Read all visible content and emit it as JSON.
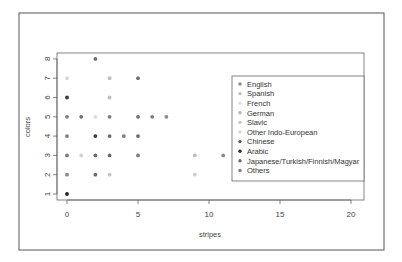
{
  "chart_data": {
    "type": "scatter",
    "title": "",
    "xlabel": "stripes",
    "ylabel": "colors",
    "xlim": [
      0,
      20
    ],
    "ylim": [
      1,
      8
    ],
    "x_ticks": [
      0,
      5,
      10,
      15,
      20
    ],
    "y_ticks": [
      1,
      2,
      3,
      4,
      5,
      6,
      7,
      8
    ],
    "grid": false,
    "legend_position": "right",
    "legend": [
      {
        "label": "English",
        "color": "#8a8a8a"
      },
      {
        "label": "Spanish",
        "color": "#bdbdbd"
      },
      {
        "label": "French",
        "color": "#dedede"
      },
      {
        "label": "German",
        "color": "#b4b4b4"
      },
      {
        "label": "Slavic",
        "color": "#c6c6c6"
      },
      {
        "label": "Other Indo-European",
        "color": "#d8d8d8"
      },
      {
        "label": "Chinese",
        "color": "#555555"
      },
      {
        "label": "Arabic",
        "color": "#2e2e2e"
      },
      {
        "label": "Japanese/Turkish/Finnish/Magyar",
        "color": "#6a6a6a"
      },
      {
        "label": "Others",
        "color": "#7c7c7c"
      }
    ],
    "points": [
      {
        "x": 2,
        "y": 8,
        "color": "#6f6f6f"
      },
      {
        "x": 0,
        "y": 7,
        "color": "#d6d6d6"
      },
      {
        "x": 3,
        "y": 7,
        "color": "#bdbdbd"
      },
      {
        "x": 5,
        "y": 7,
        "color": "#6f6f6f"
      },
      {
        "x": 0,
        "y": 6,
        "color": "#3a3a3a"
      },
      {
        "x": 3,
        "y": 6,
        "color": "#bdbdbd"
      },
      {
        "x": 0,
        "y": 5,
        "color": "#7c7c7c"
      },
      {
        "x": 1,
        "y": 5,
        "color": "#6f6f6f"
      },
      {
        "x": 2,
        "y": 5,
        "color": "#dadada"
      },
      {
        "x": 3,
        "y": 5,
        "color": "#7c7c7c"
      },
      {
        "x": 5,
        "y": 5,
        "color": "#6f6f6f"
      },
      {
        "x": 6,
        "y": 5,
        "color": "#7c7c7c"
      },
      {
        "x": 7,
        "y": 5,
        "color": "#8a8a8a"
      },
      {
        "x": 0,
        "y": 4,
        "color": "#7c7c7c"
      },
      {
        "x": 2,
        "y": 4,
        "color": "#3a3a3a"
      },
      {
        "x": 3,
        "y": 4,
        "color": "#6a6a6a"
      },
      {
        "x": 4,
        "y": 4,
        "color": "#7c7c7c"
      },
      {
        "x": 5,
        "y": 4,
        "color": "#6a6a6a"
      },
      {
        "x": 0,
        "y": 3,
        "color": "#7c7c7c"
      },
      {
        "x": 1,
        "y": 3,
        "color": "#d2d2d2"
      },
      {
        "x": 2,
        "y": 3,
        "color": "#6a6a6a"
      },
      {
        "x": 3,
        "y": 3,
        "color": "#6a6a6a"
      },
      {
        "x": 5,
        "y": 3,
        "color": "#7c7c7c"
      },
      {
        "x": 9,
        "y": 3,
        "color": "#bdbdbd"
      },
      {
        "x": 11,
        "y": 3,
        "color": "#8a8a8a"
      },
      {
        "x": 0,
        "y": 2,
        "color": "#8a8a8a"
      },
      {
        "x": 2,
        "y": 2,
        "color": "#6a6a6a"
      },
      {
        "x": 3,
        "y": 2,
        "color": "#c6c6c6"
      },
      {
        "x": 9,
        "y": 2,
        "color": "#cfcfcf"
      },
      {
        "x": 0,
        "y": 1,
        "color": "#222222"
      }
    ]
  },
  "layout": {
    "frame": {
      "x": 19,
      "y": 13,
      "w": 365,
      "h": 237
    },
    "plot": {
      "x": 57,
      "y": 53,
      "w": 307,
      "h": 147
    },
    "x0_px": 67,
    "x_unit_px": 14.2,
    "y1_px": 194,
    "y_unit_px": 19.3,
    "legend_box": {
      "x": 232,
      "y": 76,
      "w": 132,
      "h": 105
    }
  }
}
